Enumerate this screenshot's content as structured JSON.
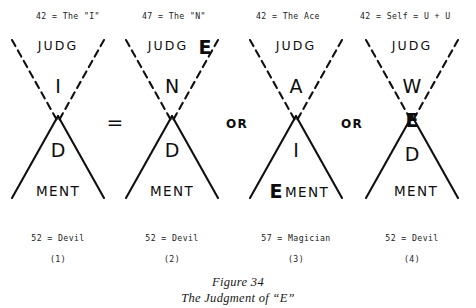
{
  "figure": {
    "caption_line1": "Figure 34",
    "caption_line2": "The Judgment of “E”",
    "ink_color": "#101010",
    "background_color": "#ffffff"
  },
  "top_annotations": [
    {
      "text": "42 = The \"I\""
    },
    {
      "text": "47 = The \"N\""
    },
    {
      "text": "42 = The Ace"
    },
    {
      "text": "42 = Self = U + U"
    }
  ],
  "operators": [
    {
      "symbol": "=",
      "between": "1-2"
    },
    {
      "symbol": "OR",
      "between": "2-3"
    },
    {
      "symbol": "OR",
      "between": "3-4"
    }
  ],
  "diagrams": [
    {
      "index": "(1)",
      "top_word": "JUDG",
      "upper_letter": "I",
      "lower_letter": "D",
      "base_word": "MENT",
      "base_prefix": "",
      "center_letter": "",
      "top_suffix": ""
    },
    {
      "index": "(2)",
      "top_word": "JUDG",
      "top_suffix": "E",
      "upper_letter": "N",
      "lower_letter": "D",
      "base_word": "MENT",
      "base_prefix": "",
      "center_letter": ""
    },
    {
      "index": "(3)",
      "top_word": "JUDG",
      "top_suffix": "",
      "upper_letter": "A",
      "lower_letter": "I",
      "base_word": "MENT",
      "base_prefix": "E",
      "center_letter": ""
    },
    {
      "index": "(4)",
      "top_word": "JUDG",
      "top_suffix": "",
      "upper_letter": "W",
      "lower_letter": "D",
      "base_word": "MENT",
      "base_prefix": "",
      "center_letter": "E"
    }
  ],
  "bottom_annotations": [
    {
      "text": "52 = Devil"
    },
    {
      "text": "52 = Devil"
    },
    {
      "text": "57 = Magician"
    },
    {
      "text": "52 = Devil"
    }
  ],
  "index_labels": [
    {
      "text": "(1)"
    },
    {
      "text": "(2)"
    },
    {
      "text": "(3)"
    },
    {
      "text": "(4)"
    }
  ]
}
